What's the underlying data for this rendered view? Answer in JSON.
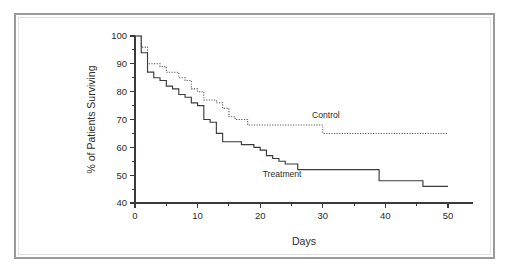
{
  "figure": {
    "frame_color": "#9a9a9a",
    "background_color": "#ffffff"
  },
  "chart_data": {
    "type": "line",
    "subtype": "kaplan-meier-step",
    "title": "",
    "subtitle": "",
    "xlabel": "Days",
    "ylabel": "% of Patients  Surviving",
    "xlim": [
      0,
      54
    ],
    "ylim": [
      40,
      100
    ],
    "xticks": [
      0,
      10,
      20,
      30,
      40,
      50
    ],
    "xtick_labels": [
      "0",
      "10",
      "20",
      "30",
      "40",
      "50"
    ],
    "xticks_minor": [
      5,
      15,
      25,
      35,
      45
    ],
    "yticks": [
      40,
      50,
      60,
      70,
      80,
      90,
      100
    ],
    "ytick_labels": [
      "40",
      "50",
      "60",
      "70",
      "80",
      "90",
      "100"
    ],
    "yticks_minor": [
      45,
      55,
      65,
      75,
      85,
      95
    ],
    "grid": false,
    "legend_position": "inline-annotation",
    "annotations": [
      {
        "text": "Control",
        "x": 30.5,
        "y": 70.6
      },
      {
        "text": "Treatment",
        "x": 23.5,
        "y": 49.3
      }
    ],
    "series": [
      {
        "name": "Control",
        "style": "dotted",
        "color": "#5a5a5a",
        "points": [
          [
            0,
            100
          ],
          [
            1,
            100
          ],
          [
            1,
            96
          ],
          [
            2,
            96
          ],
          [
            2,
            90
          ],
          [
            4,
            90
          ],
          [
            4,
            89
          ],
          [
            5,
            89
          ],
          [
            5,
            87
          ],
          [
            7,
            87
          ],
          [
            7,
            85
          ],
          [
            8,
            85
          ],
          [
            8,
            84
          ],
          [
            9,
            84
          ],
          [
            9,
            81
          ],
          [
            10,
            81
          ],
          [
            10,
            80
          ],
          [
            11,
            80
          ],
          [
            11,
            77
          ],
          [
            13,
            77
          ],
          [
            13,
            76
          ],
          [
            14,
            76
          ],
          [
            14,
            74
          ],
          [
            15,
            74
          ],
          [
            15,
            71
          ],
          [
            16,
            71
          ],
          [
            16,
            70
          ],
          [
            18,
            70
          ],
          [
            18,
            68
          ],
          [
            30,
            68
          ],
          [
            30,
            65
          ],
          [
            50,
            65
          ]
        ]
      },
      {
        "name": "Treatment",
        "style": "solid",
        "color": "#3b3b3b",
        "points": [
          [
            0,
            100
          ],
          [
            1,
            100
          ],
          [
            1,
            94
          ],
          [
            2,
            94
          ],
          [
            2,
            87
          ],
          [
            3,
            87
          ],
          [
            3,
            85
          ],
          [
            4,
            85
          ],
          [
            4,
            84
          ],
          [
            5,
            84
          ],
          [
            5,
            82
          ],
          [
            6,
            82
          ],
          [
            6,
            81
          ],
          [
            7,
            81
          ],
          [
            7,
            79
          ],
          [
            8,
            79
          ],
          [
            8,
            78
          ],
          [
            9,
            78
          ],
          [
            9,
            76
          ],
          [
            10,
            76
          ],
          [
            10,
            75
          ],
          [
            11,
            75
          ],
          [
            11,
            70
          ],
          [
            12,
            70
          ],
          [
            12,
            69
          ],
          [
            13,
            69
          ],
          [
            13,
            65
          ],
          [
            14,
            65
          ],
          [
            14,
            62
          ],
          [
            17,
            62
          ],
          [
            17,
            61
          ],
          [
            19,
            61
          ],
          [
            19,
            60
          ],
          [
            20,
            60
          ],
          [
            20,
            59
          ],
          [
            21,
            59
          ],
          [
            21,
            57
          ],
          [
            22,
            57
          ],
          [
            22,
            56
          ],
          [
            23,
            56
          ],
          [
            23,
            55
          ],
          [
            24,
            55
          ],
          [
            24,
            54
          ],
          [
            26,
            54
          ],
          [
            26,
            52
          ],
          [
            39,
            52
          ],
          [
            39,
            48
          ],
          [
            46,
            48
          ],
          [
            46,
            46
          ],
          [
            50,
            46
          ]
        ]
      }
    ]
  }
}
